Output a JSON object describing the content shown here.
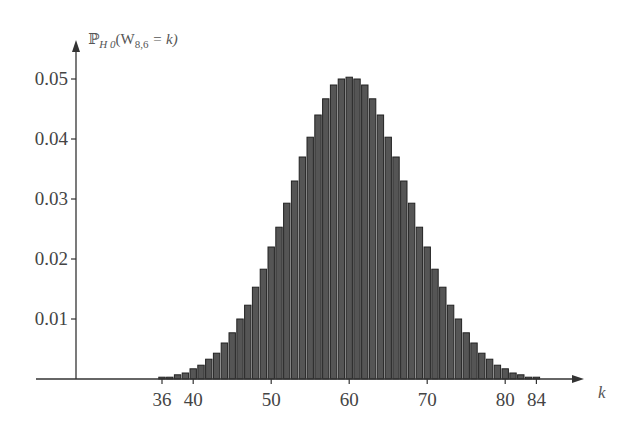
{
  "chart_data": {
    "type": "bar",
    "title": "",
    "ylabel": "ℙ_H0(W_8,6 = k)",
    "ylabel_parts": {
      "p": "ℙ",
      "sub": "H 0",
      "open": "(W",
      "wsub": "8,6",
      "rest": " =  k)"
    },
    "xlabel": "k",
    "xticks": [
      36,
      40,
      50,
      60,
      70,
      80,
      84
    ],
    "yticks": [
      0.01,
      0.02,
      0.03,
      0.04,
      0.05
    ],
    "ytick_labels": [
      "0.01",
      "0.02",
      "0.03",
      "0.04",
      "0.05"
    ],
    "ylim": [
      0,
      0.052
    ],
    "xlim": [
      36,
      84
    ],
    "grid": false,
    "categories": [
      36,
      37,
      38,
      39,
      40,
      41,
      42,
      43,
      44,
      45,
      46,
      47,
      48,
      49,
      50,
      51,
      52,
      53,
      54,
      55,
      56,
      57,
      58,
      59,
      60,
      61,
      62,
      63,
      64,
      65,
      66,
      67,
      68,
      69,
      70,
      71,
      72,
      73,
      74,
      75,
      76,
      77,
      78,
      79,
      80,
      81,
      82,
      83,
      84
    ],
    "values": [
      0.0003,
      0.0003,
      0.0007,
      0.001,
      0.0017,
      0.0023,
      0.0033,
      0.0043,
      0.006,
      0.0077,
      0.01,
      0.0123,
      0.0153,
      0.0183,
      0.022,
      0.0253,
      0.0293,
      0.033,
      0.037,
      0.0403,
      0.044,
      0.0467,
      0.049,
      0.05,
      0.0503,
      0.05,
      0.049,
      0.0467,
      0.044,
      0.0403,
      0.037,
      0.033,
      0.0293,
      0.0253,
      0.022,
      0.0183,
      0.0153,
      0.0123,
      0.01,
      0.0077,
      0.006,
      0.0043,
      0.0033,
      0.0023,
      0.0017,
      0.001,
      0.0007,
      0.0003,
      0.0003
    ]
  }
}
